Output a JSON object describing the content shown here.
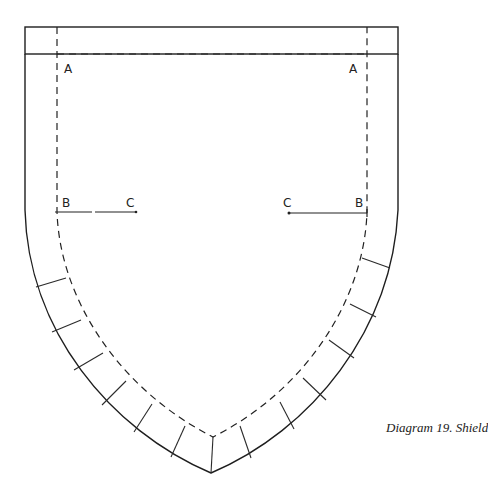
{
  "diagram": {
    "caption": "Diagram 19. Shield",
    "labels": {
      "a_left": "A",
      "a_right": "A",
      "b_left": "B",
      "c_left": "C",
      "c_right": "C",
      "b_right": "B"
    },
    "colors": {
      "line": "#1e1e1e",
      "background": "#ffffff"
    }
  }
}
